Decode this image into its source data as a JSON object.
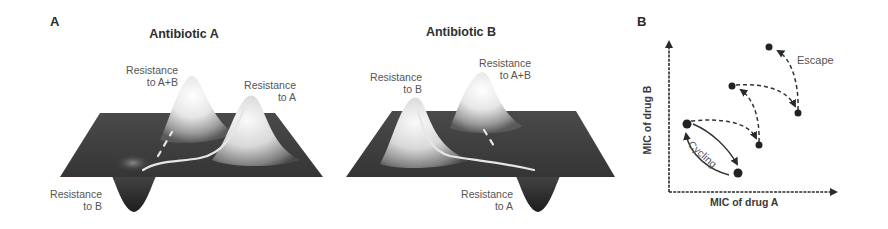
{
  "figure": {
    "panel_a": {
      "letter": "A",
      "landscapes": [
        {
          "title": "Antibiotic A",
          "peaks": [
            {
              "label_line1": "Resistance",
              "label_line2": "to A+B"
            },
            {
              "label_line1": "Resistance",
              "label_line2": "to A"
            }
          ],
          "valley": {
            "label_line1": "Resistance",
            "label_line2": "to B"
          }
        },
        {
          "title": "Antibiotic B",
          "peaks": [
            {
              "label_line1": "Resistance",
              "label_line2": "to B"
            },
            {
              "label_line1": "Resistance",
              "label_line2": "to A+B"
            }
          ],
          "valley": {
            "label_line1": "Resistance",
            "label_line2": "to A"
          }
        }
      ]
    },
    "panel_b": {
      "letter": "B",
      "x_axis_label": "MIC of drug A",
      "y_axis_label": "MIC of drug B",
      "annotations": {
        "cycling": "Cycling",
        "escape": "Escape"
      }
    }
  },
  "colors": {
    "surface_dark": "#3c3c3c",
    "peak_light": "#f2f2f2",
    "path": "#e8e8e8",
    "ink": "#2a2a2a"
  }
}
